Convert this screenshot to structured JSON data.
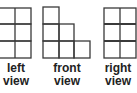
{
  "diagram": {
    "views": [
      {
        "name": "left",
        "label_line1": "left",
        "label_line2": "view",
        "columns": [
          3,
          3
        ],
        "cell": 16
      },
      {
        "name": "front",
        "label_line1": "front",
        "label_line2": "view",
        "columns": [
          3,
          2,
          1
        ],
        "cell": 16
      },
      {
        "name": "right",
        "label_line1": "right",
        "label_line2": "view",
        "columns": [
          3,
          3
        ],
        "cell": 16
      }
    ],
    "line_color": "#3a3a3a"
  }
}
